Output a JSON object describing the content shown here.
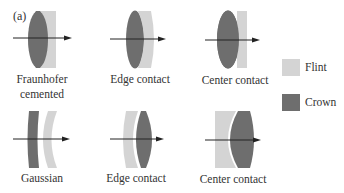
{
  "figure": {
    "panel_label": "(a)",
    "colors": {
      "flint": "#d4d4d4",
      "crown": "#6e6e6e",
      "axis": "#222222",
      "background": "#ffffff"
    },
    "row1": [
      {
        "caption_line1": "Fraunhofer",
        "caption_line2": "cemented",
        "type": "fraunhofer-cemented"
      },
      {
        "caption_line1": "Edge contact",
        "type": "edge-contact"
      },
      {
        "caption_line1": "Center contact",
        "type": "center-contact"
      }
    ],
    "row2": [
      {
        "caption_line1": "Gaussian",
        "type": "gaussian"
      },
      {
        "caption_line1": "Edge contact",
        "type": "edge-contact"
      },
      {
        "caption_line1": "Center contact",
        "type": "center-contact"
      }
    ],
    "legend": [
      {
        "label": "Flint",
        "color": "#d4d4d4"
      },
      {
        "label": "Crown",
        "color": "#6e6e6e"
      }
    ]
  }
}
